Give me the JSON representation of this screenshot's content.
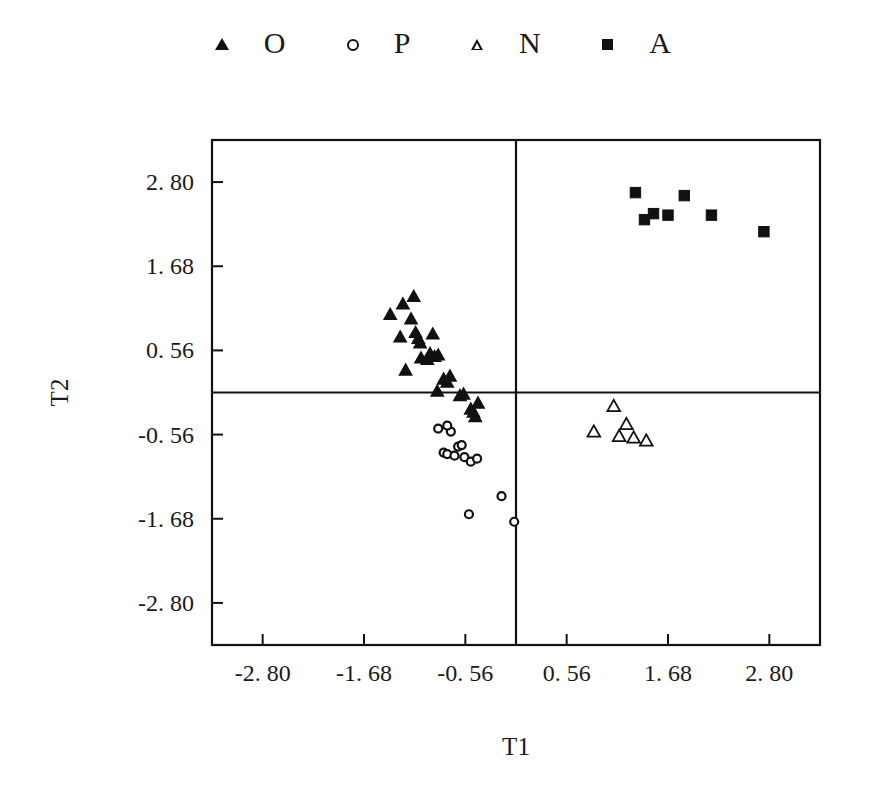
{
  "chart_data": {
    "type": "scatter",
    "title": "",
    "xlabel": "T1",
    "ylabel": "T2",
    "xlim": [
      -3.36,
      3.36
    ],
    "ylim": [
      -3.36,
      3.36
    ],
    "xticks": [
      -2.8,
      -1.68,
      -0.56,
      0.56,
      1.68,
      2.8
    ],
    "yticks": [
      -2.8,
      -1.68,
      -0.56,
      0.56,
      1.68,
      2.8
    ],
    "xtick_labels": [
      "-2. 80",
      "-1. 68",
      "-0. 56",
      "0. 56",
      "1. 68",
      "2. 80"
    ],
    "ytick_labels": [
      "-2. 80",
      "-1. 68",
      "-0. 56",
      "0. 56",
      "1. 68",
      "2. 80"
    ],
    "grid": false,
    "zero_lines": true,
    "legend_position": "top-center",
    "series": [
      {
        "name": "O",
        "marker": "triangle-filled",
        "color": "#111111",
        "points": [
          [
            -1.13,
            1.28
          ],
          [
            -1.25,
            1.18
          ],
          [
            -1.39,
            1.04
          ],
          [
            -1.16,
            0.98
          ],
          [
            -1.28,
            0.74
          ],
          [
            -1.11,
            0.8
          ],
          [
            -1.08,
            0.72
          ],
          [
            -1.06,
            0.66
          ],
          [
            -0.92,
            0.78
          ],
          [
            -1.05,
            0.46
          ],
          [
            -0.98,
            0.44
          ],
          [
            -0.95,
            0.52
          ],
          [
            -0.9,
            0.48
          ],
          [
            -0.86,
            0.5
          ],
          [
            -1.22,
            0.3
          ],
          [
            -0.8,
            0.18
          ],
          [
            -0.76,
            0.14
          ],
          [
            -0.73,
            0.22
          ],
          [
            -0.87,
            0.02
          ],
          [
            -0.62,
            -0.04
          ],
          [
            -0.58,
            -0.02
          ],
          [
            -0.42,
            -0.14
          ],
          [
            -0.5,
            -0.22
          ],
          [
            -0.47,
            -0.26
          ],
          [
            -0.45,
            -0.32
          ]
        ]
      },
      {
        "name": "P",
        "marker": "circle-open",
        "color": "#111111",
        "points": [
          [
            -0.72,
            -0.52
          ],
          [
            -0.76,
            -0.44
          ],
          [
            -0.86,
            -0.48
          ],
          [
            -0.64,
            -0.72
          ],
          [
            -0.6,
            -0.7
          ],
          [
            -0.8,
            -0.8
          ],
          [
            -0.76,
            -0.82
          ],
          [
            -0.68,
            -0.84
          ],
          [
            -0.57,
            -0.86
          ],
          [
            -0.5,
            -0.92
          ],
          [
            -0.43,
            -0.88
          ],
          [
            -0.16,
            -1.38
          ],
          [
            -0.52,
            -1.62
          ],
          [
            -0.02,
            -1.72
          ]
        ]
      },
      {
        "name": "N",
        "marker": "triangle-open",
        "color": "#111111",
        "points": [
          [
            1.08,
            -0.18
          ],
          [
            0.86,
            -0.52
          ],
          [
            1.22,
            -0.42
          ],
          [
            1.14,
            -0.58
          ],
          [
            1.3,
            -0.6
          ],
          [
            1.44,
            -0.64
          ]
        ]
      },
      {
        "name": "A",
        "marker": "square-filled",
        "color": "#111111",
        "points": [
          [
            1.32,
            2.66
          ],
          [
            1.86,
            2.62
          ],
          [
            1.52,
            2.38
          ],
          [
            1.68,
            2.36
          ],
          [
            1.42,
            2.3
          ],
          [
            2.16,
            2.36
          ],
          [
            2.74,
            2.14
          ]
        ]
      }
    ]
  },
  "legend": {
    "items": [
      {
        "marker": "triangle-filled",
        "label": "O"
      },
      {
        "marker": "circle-open",
        "label": "P"
      },
      {
        "marker": "triangle-open",
        "label": "N"
      },
      {
        "marker": "square-filled",
        "label": "A"
      }
    ]
  },
  "axes": {
    "x_title": "T1",
    "y_title": "T2"
  },
  "style": {
    "ink": "#111111",
    "background": "#ffffff"
  }
}
